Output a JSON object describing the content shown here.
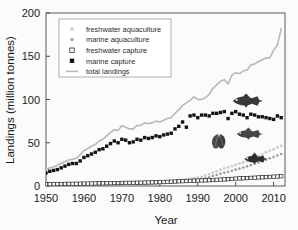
{
  "figure": {
    "background_color": "#fbfbfb",
    "frame_color": "#5a5a5a"
  },
  "chart_data": {
    "type": "line",
    "title": "",
    "xlabel": "Year",
    "ylabel": "Landings (million tonnes)",
    "xlim": [
      1950,
      2013
    ],
    "ylim": [
      0,
      200
    ],
    "xticks": [
      1950,
      1960,
      1970,
      1980,
      1990,
      2000,
      2010
    ],
    "xtick_labels": [
      "1950",
      "1960",
      "1970",
      "1980",
      "1990",
      "2000",
      "2010"
    ],
    "yticks": [
      0,
      50,
      100,
      150,
      200
    ],
    "ytick_labels": [
      "0",
      "50",
      "100",
      "150",
      "200"
    ],
    "grid": false,
    "legend_position": "upper left",
    "x": [
      1950,
      1951,
      1952,
      1953,
      1954,
      1955,
      1956,
      1957,
      1958,
      1959,
      1960,
      1961,
      1962,
      1963,
      1964,
      1965,
      1966,
      1967,
      1968,
      1969,
      1970,
      1971,
      1972,
      1973,
      1974,
      1975,
      1976,
      1977,
      1978,
      1979,
      1980,
      1981,
      1982,
      1983,
      1984,
      1985,
      1986,
      1987,
      1988,
      1989,
      1990,
      1991,
      1992,
      1993,
      1994,
      1995,
      1996,
      1997,
      1998,
      1999,
      2000,
      2001,
      2002,
      2003,
      2004,
      2005,
      2006,
      2007,
      2008,
      2009,
      2010,
      2011,
      2012
    ],
    "series": [
      {
        "name": "total landings",
        "marker": "line",
        "color": "#b8b8b8",
        "values": [
          19,
          21,
          22,
          24,
          26,
          28,
          30,
          31,
          32,
          36,
          41,
          43,
          46,
          48,
          52,
          54,
          58,
          62,
          65,
          64,
          70,
          68,
          66,
          66,
          70,
          70,
          73,
          72,
          73,
          75,
          74,
          76,
          78,
          79,
          84,
          88,
          93,
          96,
          99,
          103,
          100,
          100,
          102,
          106,
          113,
          117,
          121,
          123,
          118,
          128,
          131,
          130,
          133,
          134,
          140,
          141,
          144,
          146,
          148,
          148,
          157,
          163,
          182
        ]
      },
      {
        "name": "marine capture",
        "marker": "filled-square",
        "color": "#141414",
        "values": [
          15,
          17,
          18,
          19,
          21,
          23,
          25,
          26,
          26,
          29,
          33,
          35,
          37,
          39,
          42,
          43,
          46,
          49,
          52,
          50,
          54,
          53,
          50,
          51,
          54,
          53,
          56,
          55,
          56,
          58,
          57,
          59,
          60,
          61,
          66,
          69,
          74,
          68,
          81,
          82,
          79,
          82,
          82,
          81,
          84,
          84,
          85,
          86,
          78,
          84,
          86,
          83,
          82,
          79,
          83,
          82,
          80,
          80,
          79,
          78,
          77,
          81,
          79
        ]
      },
      {
        "name": "freshwater capture",
        "marker": "open-square",
        "color": "#2a2a2a",
        "values": [
          2.0,
          2.1,
          2.2,
          2.3,
          2.3,
          2.4,
          2.5,
          2.5,
          2.6,
          2.7,
          2.8,
          2.8,
          2.9,
          3.0,
          3.1,
          3.1,
          3.2,
          3.3,
          3.4,
          3.4,
          3.5,
          3.6,
          3.6,
          3.7,
          3.8,
          3.9,
          4.0,
          4.1,
          4.2,
          4.3,
          4.5,
          4.6,
          4.8,
          5.0,
          5.2,
          5.4,
          5.6,
          5.8,
          6.0,
          6.2,
          6.3,
          6.4,
          6.5,
          6.7,
          6.9,
          7.2,
          7.4,
          7.6,
          7.9,
          8.2,
          8.6,
          8.8,
          9.0,
          9.2,
          9.4,
          9.6,
          9.9,
          10.1,
          10.3,
          10.5,
          10.8,
          11.0,
          11.3
        ]
      },
      {
        "name": "freshwater aquaculture",
        "marker": "light-dot",
        "color": "#cfcfcf",
        "values": [
          0.6,
          0.7,
          0.7,
          0.8,
          0.9,
          0.9,
          1.0,
          1.1,
          1.1,
          1.2,
          1.3,
          1.4,
          1.4,
          1.5,
          1.6,
          1.7,
          1.8,
          1.9,
          2.0,
          2.1,
          2.2,
          2.3,
          2.4,
          2.6,
          2.8,
          3.0,
          3.2,
          3.4,
          3.6,
          3.9,
          4.2,
          4.5,
          4.9,
          5.3,
          5.8,
          6.4,
          7.0,
          7.7,
          8.4,
          9.2,
          9.9,
          10.8,
          12.0,
          13.6,
          15.3,
          17.0,
          18.8,
          20.4,
          21.8,
          23.2,
          24.5,
          25.9,
          27.4,
          29.0,
          30.7,
          32.5,
          34.6,
          36.8,
          38.9,
          40.8,
          42.6,
          44.5,
          46.6
        ]
      },
      {
        "name": "marine aquaculture",
        "marker": "gray-dot",
        "color": "#9b9b9b",
        "values": [
          0.5,
          0.6,
          0.6,
          0.7,
          0.7,
          0.8,
          0.8,
          0.9,
          0.9,
          1.0,
          1.1,
          1.1,
          1.2,
          1.3,
          1.3,
          1.4,
          1.5,
          1.6,
          1.6,
          1.7,
          1.8,
          1.9,
          2.0,
          2.1,
          2.3,
          2.4,
          2.6,
          2.7,
          2.9,
          3.1,
          3.3,
          3.5,
          3.8,
          4.1,
          4.4,
          4.8,
          5.2,
          5.7,
          6.2,
          6.8,
          7.4,
          8.1,
          9.0,
          10.2,
          11.5,
          12.8,
          14.1,
          15.3,
          16.5,
          17.7,
          18.9,
          20.1,
          21.4,
          22.7,
          24.1,
          25.6,
          27.2,
          28.8,
          30.4,
          32.0,
          33.6,
          35.2,
          37.0
        ]
      }
    ]
  },
  "legend": {
    "entries": [
      {
        "label": "freshwater aquaculture",
        "marker": "light-dot",
        "color": "#cfcfcf"
      },
      {
        "label": "marine aquaculture",
        "marker": "gray-dot",
        "color": "#9b9b9b"
      },
      {
        "label": "freshwater capture",
        "marker": "open-square",
        "color": "#2a2a2a"
      },
      {
        "label": "marine capture",
        "marker": "filled-square",
        "color": "#141414"
      },
      {
        "label": "total landings",
        "marker": "line",
        "color": "#b8b8b8"
      }
    ]
  },
  "annotations": {
    "fish_icons": [
      {
        "name": "cod-fish-icon",
        "near_series": "marine capture"
      },
      {
        "name": "trout-fish-icon",
        "near_series": "freshwater aquaculture"
      },
      {
        "name": "shellfish-icon",
        "near_series": "marine aquaculture"
      },
      {
        "name": "carp-fish-icon",
        "near_series": "freshwater capture"
      }
    ]
  }
}
